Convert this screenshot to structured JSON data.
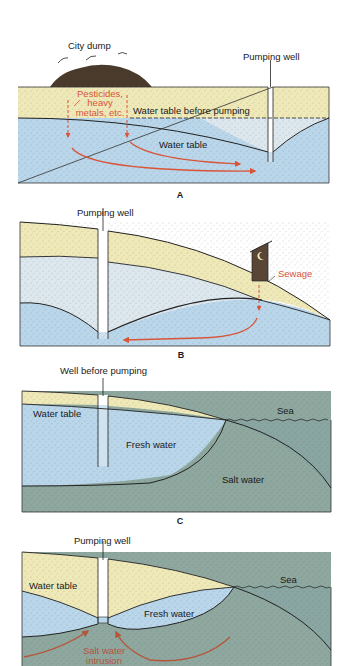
{
  "figure": {
    "panels": [
      {
        "letter": "A",
        "labels": {
          "dump": "City dump",
          "well": "Pumping well",
          "contaminants_line1": "Pesticides,",
          "contaminants_line2": "heavy",
          "contaminants_line3": "metals, etc.",
          "water_table_before": "Water table before pumping",
          "water_table": "Water table"
        }
      },
      {
        "letter": "B",
        "labels": {
          "well": "Pumping well",
          "sewage": "Sewage"
        }
      },
      {
        "letter": "C",
        "labels": {
          "well": "Well before pumping",
          "water_table": "Water table",
          "sea": "Sea",
          "fresh_water": "Fresh water",
          "salt_water": "Salt water"
        }
      },
      {
        "letter": "D",
        "labels": {
          "well": "Pumping well",
          "water_table": "Water table",
          "sea": "Sea",
          "fresh_water": "Fresh water",
          "intrusion_line1": "Salt water",
          "intrusion_line2": "intrusion"
        }
      }
    ],
    "colors": {
      "sand": "#efe9b8",
      "unsaturated": "#dde7ee",
      "groundwater": "#b9d6ea",
      "salt_water": "#8ea89f",
      "sea": "#8aa6a2",
      "contaminant_red": "#d9553a",
      "dump_brown": "#4a3a2c",
      "outhouse_brown": "#5a4636"
    }
  }
}
